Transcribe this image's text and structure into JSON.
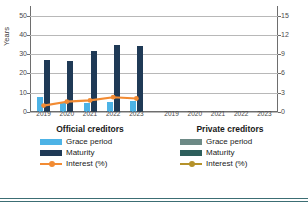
{
  "chart_data": {
    "type": "bar",
    "title": "",
    "ylabel": "Years",
    "ylabel_secondary": "Interest (%)",
    "xlabel": "",
    "ylim": [
      0,
      55
    ],
    "ylim_secondary": [
      0,
      16.5
    ],
    "yticks": [
      0,
      10,
      20,
      30,
      40,
      50
    ],
    "yticks_secondary": [
      0,
      3,
      6,
      9,
      12,
      15
    ],
    "grid": true,
    "legend_position": "bottom",
    "categories": [
      "2019",
      "2020",
      "2021",
      "2022",
      "2023"
    ],
    "panels": [
      {
        "name": "Official creditors",
        "series": [
          {
            "name": "Grace period",
            "type": "bar",
            "axis": "left",
            "color": "#4db3e6",
            "values": [
              8.0,
              4.5,
              4.5,
              5.0,
              5.5
            ]
          },
          {
            "name": "Maturity",
            "type": "bar",
            "axis": "left",
            "color": "#1f3a56",
            "values": [
              27.0,
              26.5,
              31.5,
              35.0,
              34.0
            ]
          },
          {
            "name": "Interest (%)",
            "type": "line",
            "axis": "right",
            "color": "#f28b33",
            "values": [
              1.0,
              1.6,
              1.8,
              2.3,
              2.1
            ]
          }
        ]
      },
      {
        "name": "Private creditors",
        "series": [
          {
            "name": "Grace period",
            "type": "bar",
            "axis": "left",
            "color": "#6d8a86",
            "values": [
              null,
              null,
              null,
              null,
              null
            ]
          },
          {
            "name": "Maturity",
            "type": "bar",
            "axis": "left",
            "color": "#2e5f5c",
            "values": [
              null,
              null,
              null,
              null,
              null
            ]
          },
          {
            "name": "Interest (%)",
            "type": "line",
            "axis": "right",
            "color": "#b5922a",
            "values": [
              null,
              null,
              null,
              null,
              null
            ]
          }
        ]
      }
    ]
  },
  "axes": {
    "left_title": "Years",
    "right_title": "Interest (%)",
    "left_ticks": [
      "50",
      "40",
      "30",
      "20",
      "10",
      "0"
    ],
    "right_ticks": [
      "15",
      "12",
      "9",
      "6",
      "3",
      "0"
    ]
  },
  "panels": {
    "official": {
      "title": "Official creditors",
      "xlabels": [
        "2019",
        "2020",
        "2021",
        "2022",
        "2023"
      ],
      "legend": [
        {
          "label": "Grace period",
          "color": "#4db3e6",
          "kind": "swatch"
        },
        {
          "label": "Maturity",
          "color": "#1f3a56",
          "kind": "swatch"
        },
        {
          "label": "Interest (%)",
          "color": "#f28b33",
          "kind": "line"
        }
      ]
    },
    "private": {
      "title": "Private creditors",
      "xlabels": [
        "2019",
        "2020",
        "2021",
        "2022",
        "2023"
      ],
      "legend": [
        {
          "label": "Grace period",
          "color": "#6d8a86",
          "kind": "swatch"
        },
        {
          "label": "Maturity",
          "color": "#2e5f5c",
          "kind": "swatch"
        },
        {
          "label": "Interest (%)",
          "color": "#b5922a",
          "kind": "line"
        }
      ]
    }
  },
  "colors": {
    "grid": "#b8b8b8",
    "axis": "#6e6e6e",
    "rule": "#3c6e74"
  }
}
